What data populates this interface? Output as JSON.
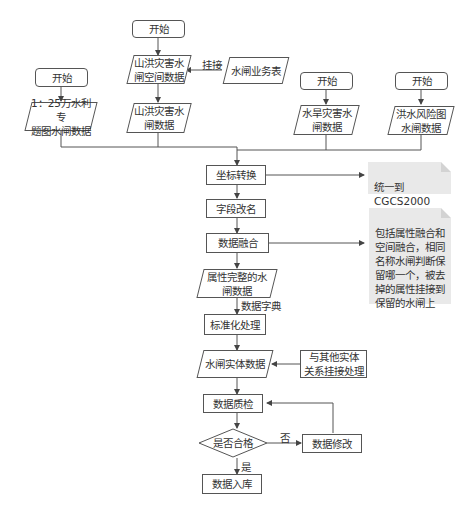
{
  "nodes": {
    "start_top": "开始",
    "start_left": "开始",
    "start_mid": "开始",
    "start_right": "开始",
    "shanhong_spatial": "山洪灾害水\n闸空间数据",
    "shuizha_business": "水闸业务表",
    "data_1_25": "1：25万水利专\n题图水闸数据",
    "shanhong_data": "山洪灾害水\n闸数据",
    "shuihan_data": "水旱灾害水\n闸数据",
    "hongshui_data": "洪水风险图\n水闸数据",
    "coord_transform": "坐标转换",
    "field_rename": "字段改名",
    "data_fusion": "数据融合",
    "attr_complete": "属性完整的水\n闸数据",
    "standardize": "标准化处理",
    "entity_data": "水闸实体数据",
    "link_other": "与其他实体\n关系挂接处理",
    "quality_check": "数据质检",
    "is_qualified": "是否合格",
    "data_modify": "数据修改",
    "data_store": "数据入库"
  },
  "notes": {
    "cgcs": "统一到CGCS2000\n坐标系",
    "fusion_desc": "包括属性融合和\n空间融合，相同\n名称水闸判断保\n留哪一个，被去\n掉的属性挂接到\n保留的水闸上"
  },
  "edge_labels": {
    "guajie": "挂接",
    "data_dict": "数据字典",
    "no": "否",
    "yes": "是"
  }
}
